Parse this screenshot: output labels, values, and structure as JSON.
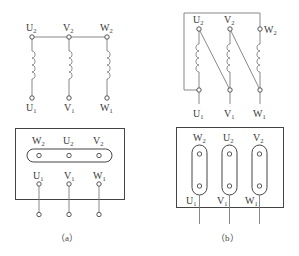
{
  "diagram_a": {
    "caption": "（a）",
    "windings": [
      {
        "top": {
          "main": "U",
          "sub": "2"
        },
        "bottom": {
          "main": "U",
          "sub": "1"
        }
      },
      {
        "top": {
          "main": "V",
          "sub": "2"
        },
        "bottom": {
          "main": "V",
          "sub": "1"
        }
      },
      {
        "top": {
          "main": "W",
          "sub": "2"
        },
        "bottom": {
          "main": "W",
          "sub": "1"
        }
      }
    ],
    "connection": "star",
    "terminal_box": {
      "top_labels": [
        {
          "main": "W",
          "sub": "2"
        },
        {
          "main": "U",
          "sub": "2"
        },
        {
          "main": "V",
          "sub": "2"
        }
      ],
      "bottom_labels": [
        {
          "main": "U",
          "sub": "1"
        },
        {
          "main": "V",
          "sub": "1"
        },
        {
          "main": "W",
          "sub": "1"
        }
      ],
      "link": "horizontal bar joining W2, U2, V2"
    }
  },
  "diagram_b": {
    "caption": "（b）",
    "windings": [
      {
        "top": {
          "main": "U",
          "sub": "2"
        },
        "bottom": {
          "main": "U",
          "sub": "1"
        }
      },
      {
        "top": {
          "main": "V",
          "sub": "2"
        },
        "bottom": {
          "main": "V",
          "sub": "1"
        }
      },
      {
        "top": {
          "main": "W",
          "sub": "2"
        },
        "bottom": {
          "main": "W",
          "sub": "1"
        }
      }
    ],
    "connection": "delta",
    "terminal_box": {
      "top_labels": [
        {
          "main": "W",
          "sub": "2"
        },
        {
          "main": "U",
          "sub": "2"
        },
        {
          "main": "V",
          "sub": "2"
        }
      ],
      "bottom_labels": [
        {
          "main": "U",
          "sub": "1"
        },
        {
          "main": "V",
          "sub": "1"
        },
        {
          "main": "W",
          "sub": "1"
        }
      ],
      "link": "three vertical links W2-U1, U2-V1, V2-W1"
    }
  }
}
